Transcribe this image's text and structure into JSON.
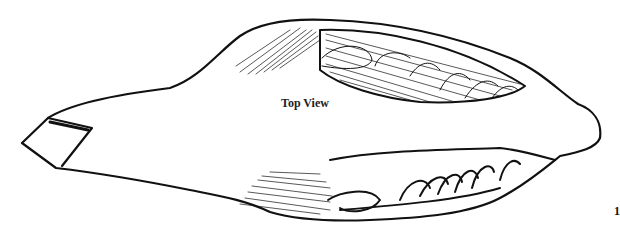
{
  "figure": {
    "label": "Top View",
    "figure_number": "1"
  },
  "colors": {
    "ink": "#111111",
    "background": "#ffffff"
  }
}
